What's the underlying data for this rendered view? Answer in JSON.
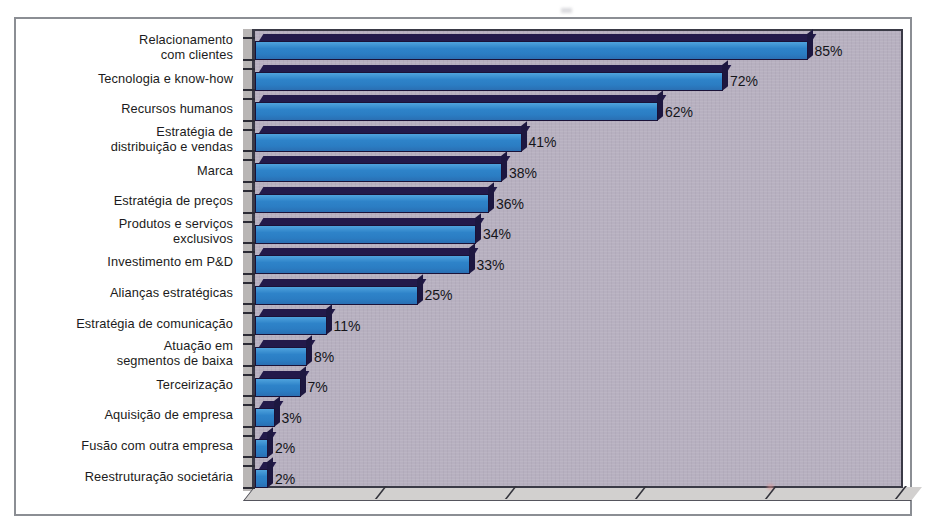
{
  "chart_data": {
    "type": "bar",
    "orientation": "horizontal",
    "title": "",
    "subtitle": "",
    "xlabel": "",
    "ylabel": "",
    "xlim": [
      0,
      100
    ],
    "grid": false,
    "legend": false,
    "value_suffix": "%",
    "categories": [
      "Relacionamento\ncom clientes",
      "Tecnologia e know-how",
      "Recursos humanos",
      "Estratégia de\ndistribuição e vendas",
      "Marca",
      "Estratégia de preços",
      "Produtos e serviços\nexclusivos",
      "Investimento em P&D",
      "Alianças estratégicas",
      "Estratégia de comunicação",
      "Atuação em\nsegmentos de baixa",
      "Terceirização",
      "Aquisição de empresa",
      "Fusão com outra empresa",
      "Reestruturação societária"
    ],
    "values": [
      85,
      72,
      62,
      41,
      38,
      36,
      34,
      33,
      25,
      11,
      8,
      7,
      3,
      2,
      2
    ],
    "value_labels": [
      "85%",
      "72%",
      "62%",
      "41%",
      "38%",
      "36%",
      "34%",
      "33%",
      "25%",
      "11%",
      "8%",
      "7%",
      "3%",
      "2%",
      "2%"
    ],
    "x_tick_positions": [
      0,
      20,
      40,
      60,
      80,
      100
    ],
    "x_tick_labels": [
      "",
      "",
      "",
      "",
      "",
      ""
    ]
  },
  "style": {
    "bar_face_color": "#2e83c9",
    "bar_highlight_color": "#4fa3dd",
    "bar_outline_color": "#1a1238",
    "bar_top_color": "#231a4a",
    "plot_background_color": "#b7b0c0",
    "figure_background_color": "#ffffff",
    "frame_color": "#8b8e94",
    "axis_color": "#3a3a46",
    "floor_color": "#d2d0cf",
    "wall_color": "#b9b6b5",
    "text_color": "#1b1b20"
  }
}
